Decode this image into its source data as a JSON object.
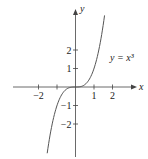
{
  "chart_data": {
    "type": "line",
    "title": "",
    "equation_label": "y = x³",
    "xlabel": "x",
    "ylabel": "y",
    "xlim": [
      -2.0,
      3.2
    ],
    "ylim": [
      -3.8,
      4.2
    ],
    "x_ticks": [
      -2,
      -1,
      1,
      2
    ],
    "x_tick_labels": [
      "−2",
      "",
      "1",
      "2"
    ],
    "y_ticks": [
      -2,
      -1,
      1,
      2
    ],
    "y_tick_labels": [
      "−2",
      "−1",
      "1",
      "2"
    ],
    "grid": false,
    "legend": "none",
    "series": [
      {
        "name": "y = x^3",
        "function": "x^3",
        "x_range": [
          -1.53,
          1.57
        ],
        "x": [
          -1.53,
          -1.25,
          -1.0,
          -0.75,
          -0.5,
          -0.25,
          0,
          0.25,
          0.5,
          0.75,
          1.0,
          1.25,
          1.57
        ],
        "y": [
          -3.58,
          -1.95,
          -1.0,
          -0.42,
          -0.125,
          -0.016,
          0,
          0.016,
          0.125,
          0.42,
          1.0,
          1.95,
          3.87
        ]
      }
    ]
  },
  "colors": {
    "axis": "#444444",
    "curve": "#555555",
    "text": "#222222",
    "background": "#ffffff"
  }
}
